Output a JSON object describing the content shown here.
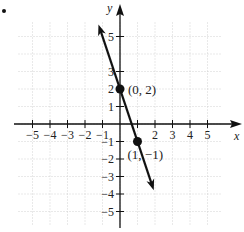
{
  "figure": {
    "bullet": "•"
  },
  "chart_data": {
    "type": "line",
    "title": "",
    "xlabel": "x",
    "ylabel": "y",
    "xlim": [
      -6,
      6
    ],
    "ylim": [
      -6,
      6
    ],
    "grid": true,
    "x_ticks": [
      -5,
      -4,
      -3,
      -2,
      -1,
      1,
      2,
      3,
      4,
      5
    ],
    "y_ticks": [
      -5,
      -4,
      -3,
      -2,
      -1,
      1,
      2,
      3,
      5
    ],
    "x_tick_labels": [
      "−5",
      "−4",
      "−3",
      "−2",
      "−1",
      "2",
      "3",
      "4",
      "5"
    ],
    "y_tick_labels": [
      "5",
      "3",
      "2",
      "1",
      "−1",
      "−2",
      "−3",
      "−4",
      "−5"
    ],
    "series": [
      {
        "name": "y = -3x + 2",
        "slope": -3,
        "intercept": 2,
        "x_range": [
          -1.2,
          1.9
        ],
        "color": "#111111"
      }
    ],
    "points": [
      {
        "x": 0,
        "y": 2,
        "label": "(0, 2)"
      },
      {
        "x": 1,
        "y": -1,
        "label": "(1, −1)"
      }
    ],
    "colors": {
      "axis": "#111111",
      "grid": "#c8c8c8",
      "line": "#111111"
    }
  }
}
